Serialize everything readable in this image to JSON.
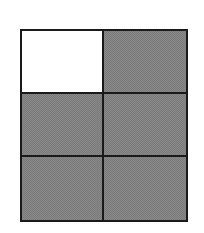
{
  "diagram": {
    "type": "fraction-grid",
    "rows": 3,
    "columns": 2,
    "total_parts": 6,
    "shaded_parts": 5,
    "unshaded_parts": 1,
    "cells": [
      {
        "row": 0,
        "col": 0,
        "shaded": false
      },
      {
        "row": 0,
        "col": 1,
        "shaded": true
      },
      {
        "row": 1,
        "col": 0,
        "shaded": true
      },
      {
        "row": 1,
        "col": 1,
        "shaded": true
      },
      {
        "row": 2,
        "col": 0,
        "shaded": true
      },
      {
        "row": 2,
        "col": 1,
        "shaded": true
      }
    ],
    "colors": {
      "shaded": "#8a8a8a",
      "unshaded": "#ffffff",
      "border": "#1a1a1a"
    }
  }
}
